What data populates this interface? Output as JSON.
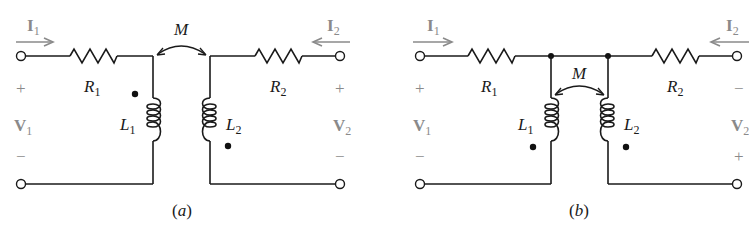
{
  "figure": {
    "panels": [
      {
        "id": "a",
        "caption_open": "(",
        "caption_letter": "a",
        "caption_close": ")",
        "current_in": {
          "symbol": "I",
          "sub": "1"
        },
        "current_out": {
          "symbol": "I",
          "sub": "2"
        },
        "voltage_left": {
          "symbol": "V",
          "sub": "1",
          "top_sign": "+",
          "bottom_sign": "−"
        },
        "voltage_right": {
          "symbol": "V",
          "sub": "2",
          "top_sign": "+",
          "bottom_sign": "−"
        },
        "resistor_left": {
          "symbol": "R",
          "sub": "1"
        },
        "resistor_right": {
          "symbol": "R",
          "sub": "2"
        },
        "inductor_left": {
          "symbol": "L",
          "sub": "1",
          "dot": "top"
        },
        "inductor_right": {
          "symbol": "L",
          "sub": "2",
          "dot": "bottom"
        },
        "mutual": {
          "symbol": "M"
        }
      },
      {
        "id": "b",
        "caption_open": "(",
        "caption_letter": "b",
        "caption_close": ")",
        "current_in": {
          "symbol": "I",
          "sub": "1"
        },
        "current_out": {
          "symbol": "I",
          "sub": "2"
        },
        "voltage_left": {
          "symbol": "V",
          "sub": "1",
          "top_sign": "+",
          "bottom_sign": "−"
        },
        "voltage_right": {
          "symbol": "V",
          "sub": "2",
          "top_sign": "−",
          "bottom_sign": "+"
        },
        "resistor_left": {
          "symbol": "R",
          "sub": "1"
        },
        "resistor_right": {
          "symbol": "R",
          "sub": "2"
        },
        "inductor_left": {
          "symbol": "L",
          "sub": "1",
          "dot": "bottom"
        },
        "inductor_right": {
          "symbol": "L",
          "sub": "2",
          "dot": "bottom"
        },
        "mutual": {
          "symbol": "M"
        }
      }
    ],
    "colors": {
      "wire": "#1a1a1a",
      "annotation_gray": "#8a8a8a",
      "background": "#ffffff"
    }
  }
}
